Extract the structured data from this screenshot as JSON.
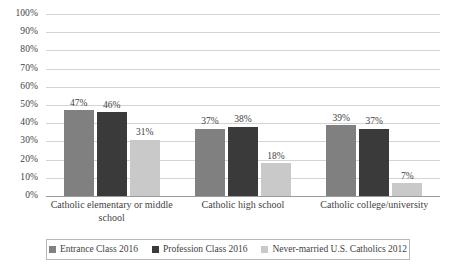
{
  "chart_data": {
    "type": "bar",
    "title": "",
    "subtitle": "",
    "xlabel": "",
    "ylabel": "",
    "ylim": [
      0,
      100
    ],
    "grid": true,
    "legend_position": "bottom",
    "value_suffix": "%",
    "categories": [
      "Catholic elementary or middle school",
      "Catholic high school",
      "Catholic college/university"
    ],
    "y_ticks": [
      "0%",
      "10%",
      "20%",
      "30%",
      "40%",
      "50%",
      "60%",
      "70%",
      "80%",
      "90%",
      "100%"
    ],
    "y_tick_values": [
      0,
      10,
      20,
      30,
      40,
      50,
      60,
      70,
      80,
      90,
      100
    ],
    "series": [
      {
        "name": "Entrance Class 2016",
        "color": "#808080",
        "values": [
          47,
          37,
          39
        ],
        "labels": [
          "47%",
          "37%",
          "39%"
        ]
      },
      {
        "name": "Profession Class 2016",
        "color": "#3a3a3a",
        "values": [
          46,
          38,
          37
        ],
        "labels": [
          "46%",
          "38%",
          "37%"
        ]
      },
      {
        "name": "Never-married U.S. Catholics 2012",
        "color": "#c9c9c9",
        "values": [
          31,
          18,
          7
        ],
        "labels": [
          "31%",
          "18%",
          "7%"
        ]
      }
    ]
  },
  "colors": {
    "background": "#ffffff",
    "gridline": "#d4d4d4",
    "axis": "#9a9a9a",
    "text": "#3f3f3f",
    "legend_border": "#b9b9b9"
  }
}
